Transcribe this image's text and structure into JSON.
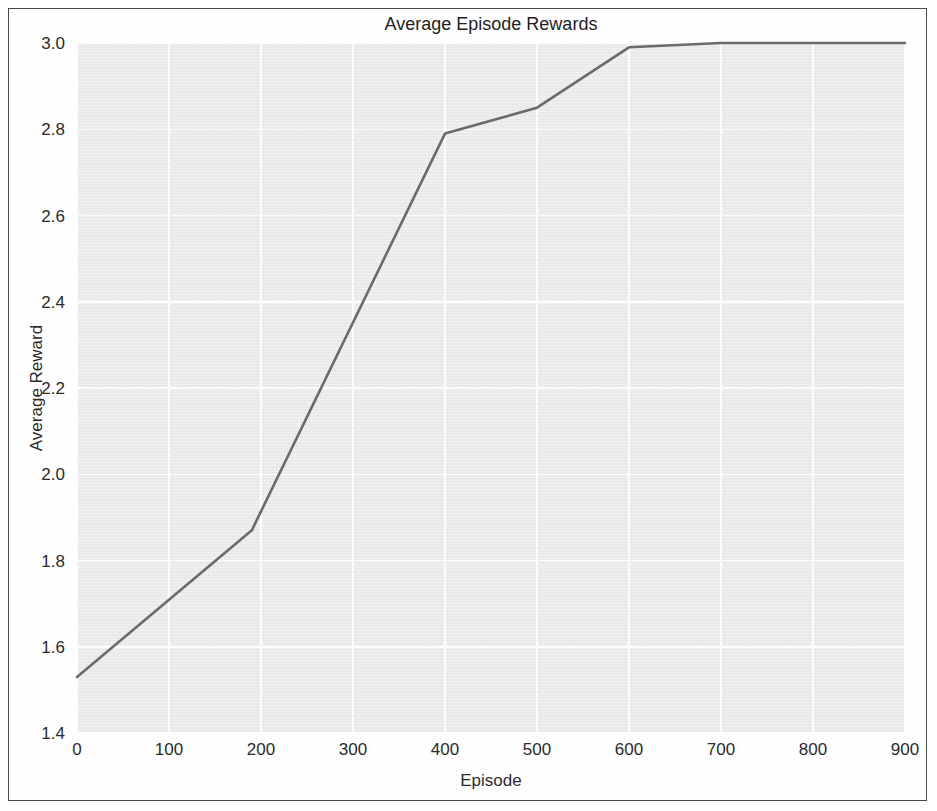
{
  "chart_data": {
    "type": "line",
    "title": "Average Episode Rewards",
    "xlabel": "Episode",
    "ylabel": "Average Reward",
    "xlim": [
      0,
      900
    ],
    "ylim": [
      1.4,
      3.0
    ],
    "xticks": [
      "0",
      "100",
      "200",
      "300",
      "400",
      "500",
      "600",
      "700",
      "800",
      "900"
    ],
    "xtick_values": [
      0,
      100,
      200,
      300,
      400,
      500,
      600,
      700,
      800,
      900
    ],
    "yticks": [
      "1.4",
      "1.6",
      "1.8",
      "2.0",
      "2.2",
      "2.4",
      "2.6",
      "2.8",
      "3.0"
    ],
    "ytick_values": [
      1.4,
      1.6,
      1.8,
      2.0,
      2.2,
      2.4,
      2.6,
      2.8,
      3.0
    ],
    "grid": true,
    "legend": false,
    "series": [
      {
        "name": "Average Reward",
        "color": "#6b6b6b",
        "x": [
          0,
          190,
          400,
          500,
          600,
          700,
          900
        ],
        "values": [
          1.53,
          1.87,
          2.79,
          2.85,
          2.99,
          3.0,
          3.0
        ]
      }
    ]
  },
  "style": {
    "panel_background": "#ececec",
    "gridline_color": "#ffffff",
    "text_color": "#2b2b2b",
    "frame_color": "#4a4a4a",
    "line_color": "#6b6b6b"
  }
}
